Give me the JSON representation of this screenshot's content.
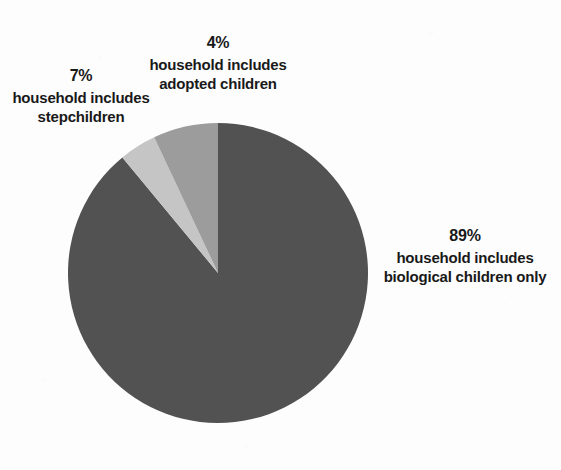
{
  "chart_data": {
    "type": "pie",
    "title": "",
    "categories": [
      "household includes biological children only",
      "household includes adopted children",
      "household includes stepchildren"
    ],
    "values": [
      89,
      4,
      7
    ],
    "value_unit": "percent",
    "legend_position": "callout-labels",
    "grid": false,
    "slices": [
      {
        "id": "biological",
        "percent_label": "89%",
        "line1": "household includes",
        "line2": "biological children only",
        "value": 89,
        "color": "#4f4f4f",
        "start_angle_deg": 0,
        "end_angle_deg": 320.4
      },
      {
        "id": "adopted",
        "percent_label": "4%",
        "line1": "household includes",
        "line2": "adopted children",
        "value": 4,
        "color": "#c4c4c4",
        "start_angle_deg": 320.4,
        "end_angle_deg": 334.8
      },
      {
        "id": "stepchildren",
        "percent_label": "7%",
        "line1": "household includes",
        "line2": "stepchildren",
        "value": 7,
        "color": "#9b9b9b",
        "start_angle_deg": 334.8,
        "end_angle_deg": 360
      }
    ]
  },
  "labels": {
    "adopted": {
      "percent": "4%",
      "line1": "household includes",
      "line2": "adopted children"
    },
    "stepchildren": {
      "percent": "7%",
      "line1": "household includes",
      "line2": "stepchildren"
    },
    "biological": {
      "percent": "89%",
      "line1": "household includes",
      "line2": "biological children only"
    }
  },
  "colors": {
    "background": "#fdfdfd",
    "text": "#151515",
    "slice_biological": "#4f4f4f",
    "slice_adopted": "#c4c4c4",
    "slice_stepchildren": "#9b9b9b"
  },
  "geometry": {
    "center_x": 150,
    "center_y": 150,
    "radius": 150
  }
}
